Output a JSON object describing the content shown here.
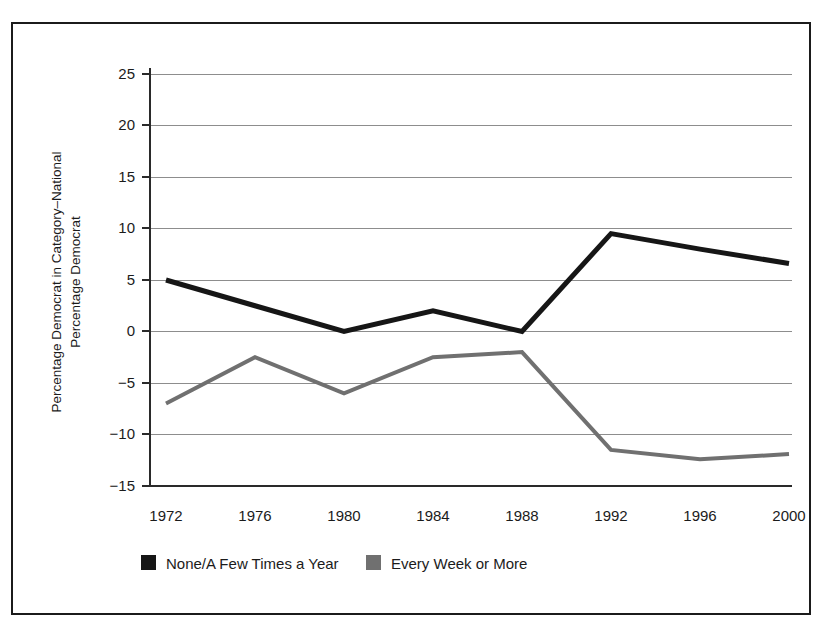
{
  "chart_data": {
    "type": "line",
    "title": "",
    "subtitle": "",
    "xlabel": "",
    "ylabel": "Percentage Democrat in Category–National Percentage Democrat",
    "ylabel_line1": "Percentage Democrat in Category–National",
    "ylabel_line2": "Percentage Democrat",
    "categories": [
      "1972",
      "1976",
      "1980",
      "1984",
      "1988",
      "1992",
      "1996",
      "2000"
    ],
    "x": [
      1972,
      1976,
      1980,
      1984,
      1988,
      1992,
      1996,
      2000
    ],
    "xtick_labels": [
      "1972",
      "1976",
      "1980",
      "1984",
      "1988",
      "1992",
      "1996",
      "2000"
    ],
    "ytick_labels": [
      "25",
      "20",
      "15",
      "10",
      "5",
      "0",
      "−5",
      "−10",
      "−15"
    ],
    "ytick_values": [
      25,
      20,
      15,
      10,
      5,
      0,
      -5,
      -10,
      -15
    ],
    "ylim": [
      -15,
      25
    ],
    "xlim": [
      1972,
      2000
    ],
    "grid": true,
    "grid_axis": "y",
    "legend_position": "bottom",
    "series": [
      {
        "name": "None/A Few Times a Year",
        "color": "#161616",
        "linewidth": 5,
        "values": [
          5.0,
          2.5,
          0.0,
          2.0,
          0.0,
          9.5,
          8.0,
          6.6
        ]
      },
      {
        "name": "Every Week or More",
        "color": "#707070",
        "linewidth": 4,
        "values": [
          -7.0,
          -2.5,
          -6.0,
          -2.5,
          -2.0,
          -11.5,
          -12.4,
          -11.9
        ]
      }
    ]
  },
  "legend": {
    "items": [
      {
        "label": "None/A Few Times a Year",
        "color": "#161616"
      },
      {
        "label": "Every Week or More",
        "color": "#707070"
      }
    ]
  }
}
